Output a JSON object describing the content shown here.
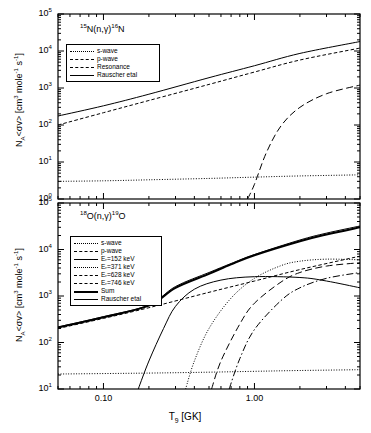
{
  "figure": {
    "width": 371,
    "height": 433,
    "background": "#ffffff",
    "line_color": "#000000"
  },
  "axes": {
    "x": {
      "label_plain": "T9 [GK]",
      "label_base": "T",
      "label_sub": "9",
      "label_unit": " [GK]",
      "scale": "log",
      "range": [
        0.05,
        5.0
      ],
      "tick_labels": [
        "0.10",
        "1.00"
      ],
      "tick_values": [
        0.1,
        1.0
      ]
    },
    "y_top": {
      "label_plain": "N_A<sv> [cm3 mole-1 s-1]",
      "scale": "log",
      "range": [
        1,
        100000
      ],
      "tick_labels": [
        "10^0",
        "10^1",
        "10^2",
        "10^3",
        "10^4",
        "10^5"
      ],
      "tick_exponents": [
        "0",
        "1",
        "2",
        "3",
        "4",
        "5"
      ]
    },
    "y_bottom": {
      "label_plain": "N_A<sv> [cm3 mole-1 s-1]",
      "scale": "log",
      "range": [
        10,
        100000
      ],
      "tick_labels": [
        "10^1",
        "10^2",
        "10^3",
        "10^4",
        "10^5"
      ],
      "tick_exponents": [
        "1",
        "2",
        "3",
        "4",
        "5"
      ]
    },
    "y_label": {
      "prefix": "N",
      "prefix_sub": "A",
      "middle": "<σv> [cm",
      "sup1": "3",
      "mid2": " mole",
      "sup2": "-1",
      "mid3": " s",
      "sup3": "-1",
      "suffix": "]"
    }
  },
  "chart_data": [
    {
      "type": "line",
      "panel": "top",
      "title": "15N(n,γ)16N",
      "annotation": {
        "pre_sup": "15",
        "elem1": "N(n,γ)",
        "post_sup": "16",
        "elem2": "N"
      },
      "xlabel": "",
      "ylabel": "N_A<σv> [cm3 mole-1 s-1]",
      "xscale": "log",
      "yscale": "log",
      "xlim": [
        0.05,
        5.0
      ],
      "ylim": [
        1,
        100000
      ],
      "grid": false,
      "legend_position": "upper-left",
      "series": [
        {
          "name": "s-wave",
          "style": "dotted",
          "width": 1,
          "points": [
            [
              0.05,
              3.0
            ],
            [
              0.1,
              3.1
            ],
            [
              0.2,
              3.3
            ],
            [
              0.5,
              3.6
            ],
            [
              1.0,
              3.9
            ],
            [
              2.0,
              4.2
            ],
            [
              5.0,
              4.5
            ]
          ]
        },
        {
          "name": "p-wave",
          "style": "dashed",
          "width": 1,
          "points": [
            [
              0.05,
              100
            ],
            [
              0.1,
              215
            ],
            [
              0.2,
              460
            ],
            [
              0.5,
              1250
            ],
            [
              1.0,
              2700
            ],
            [
              2.0,
              5700
            ],
            [
              5.0,
              12000
            ]
          ]
        },
        {
          "name": "Resonance",
          "style": "longdash",
          "width": 1,
          "points": [
            [
              0.9,
              1.0
            ],
            [
              1.0,
              2.5
            ],
            [
              1.2,
              18
            ],
            [
              1.5,
              95
            ],
            [
              2.0,
              300
            ],
            [
              3.0,
              700
            ],
            [
              5.0,
              1200
            ]
          ]
        },
        {
          "name": "Rauscher etal",
          "style": "solid",
          "width": 1,
          "points": [
            [
              0.05,
              175
            ],
            [
              0.1,
              330
            ],
            [
              0.2,
              680
            ],
            [
              0.5,
              1900
            ],
            [
              1.0,
              4000
            ],
            [
              2.0,
              8600
            ],
            [
              5.0,
              18000
            ]
          ]
        }
      ]
    },
    {
      "type": "line",
      "panel": "bottom",
      "title": "18O(n,γ)19O",
      "annotation": {
        "pre_sup": "18",
        "elem1": "O(n,γ)",
        "post_sup": "19",
        "elem2": "O"
      },
      "xlabel": "T9 [GK]",
      "ylabel": "N_A<σv> [cm3 mole-1 s-1]",
      "xscale": "log",
      "yscale": "log",
      "xlim": [
        0.05,
        5.0
      ],
      "ylim": [
        10,
        100000
      ],
      "grid": false,
      "legend_position": "upper-left",
      "series": [
        {
          "name": "s-wave",
          "style": "dotted",
          "width": 1,
          "points": [
            [
              0.05,
              21
            ],
            [
              0.2,
              22
            ],
            [
              0.5,
              23
            ],
            [
              1.0,
              24
            ],
            [
              2.0,
              25
            ],
            [
              5.0,
              26
            ]
          ]
        },
        {
          "name": "p-wave",
          "style": "dashed",
          "width": 1,
          "points": [
            [
              0.05,
              200
            ],
            [
              0.1,
              330
            ],
            [
              0.2,
              560
            ],
            [
              0.5,
              1200
            ],
            [
              1.0,
              2100
            ],
            [
              2.0,
              3700
            ],
            [
              5.0,
              7200
            ]
          ]
        },
        {
          "name": "Er=152 keV",
          "style": "solid",
          "width": 1,
          "points": [
            [
              0.17,
              10
            ],
            [
              0.2,
              40
            ],
            [
              0.25,
              200
            ],
            [
              0.3,
              600
            ],
            [
              0.4,
              1400
            ],
            [
              0.6,
              2200
            ],
            [
              1.0,
              2600
            ],
            [
              2.0,
              2500
            ],
            [
              3.0,
              2100
            ],
            [
              5.0,
              1500
            ]
          ]
        },
        {
          "name": "Er=371 keV",
          "style": "dotted",
          "width": 1,
          "points": [
            [
              0.35,
              10
            ],
            [
              0.4,
              40
            ],
            [
              0.5,
              200
            ],
            [
              0.7,
              900
            ],
            [
              1.0,
              2400
            ],
            [
              1.5,
              4500
            ],
            [
              2.0,
              5600
            ],
            [
              3.0,
              6200
            ],
            [
              5.0,
              6000
            ]
          ]
        },
        {
          "name": "Er=628 keV",
          "style": "longdash",
          "width": 1,
          "points": [
            [
              0.52,
              10
            ],
            [
              0.6,
              40
            ],
            [
              0.8,
              250
            ],
            [
              1.0,
              700
            ],
            [
              1.5,
              2000
            ],
            [
              2.0,
              3200
            ],
            [
              3.0,
              4400
            ],
            [
              5.0,
              5200
            ]
          ]
        },
        {
          "name": "Er=746 keV",
          "style": "dashdot",
          "width": 1,
          "points": [
            [
              0.68,
              10
            ],
            [
              0.8,
              45
            ],
            [
              1.0,
              190
            ],
            [
              1.5,
              800
            ],
            [
              2.0,
              1500
            ],
            [
              3.0,
              2400
            ],
            [
              5.0,
              3200
            ]
          ]
        },
        {
          "name": "Sum",
          "style": "solid",
          "width": 2,
          "points": [
            [
              0.05,
              210
            ],
            [
              0.1,
              350
            ],
            [
              0.2,
              620
            ],
            [
              0.3,
              1500
            ],
            [
              0.5,
              3000
            ],
            [
              0.7,
              4800
            ],
            [
              1.0,
              7500
            ],
            [
              2.0,
              15000
            ],
            [
              3.0,
              21000
            ],
            [
              5.0,
              30000
            ]
          ]
        },
        {
          "name": "Rauscher etal",
          "style": "solid",
          "width": 1,
          "points": [
            [
              0.05,
              215
            ],
            [
              0.1,
              360
            ],
            [
              0.2,
              640
            ],
            [
              0.3,
              1600
            ],
            [
              0.5,
              3200
            ],
            [
              0.7,
              5000
            ],
            [
              1.0,
              7800
            ],
            [
              2.0,
              16000
            ],
            [
              3.0,
              22500
            ],
            [
              5.0,
              32000
            ]
          ]
        }
      ]
    }
  ],
  "legends": {
    "top": [
      {
        "label": "s-wave",
        "style": "dotted"
      },
      {
        "label": "p-wave",
        "style": "dashed"
      },
      {
        "label": "Resonance",
        "style": "longdash"
      },
      {
        "label": "Rauscher etal",
        "style": "solid"
      }
    ],
    "bottom": [
      {
        "label": "s-wave",
        "style": "dotted"
      },
      {
        "label": "p-wave",
        "style": "dashed"
      },
      {
        "label": "Eᵣ=152 keV",
        "style": "solid"
      },
      {
        "label": "Eᵣ=371 keV",
        "style": "dotted"
      },
      {
        "label": "Eᵣ=628 keV",
        "style": "longdash"
      },
      {
        "label": "Eᵣ=746 keV",
        "style": "dashdot"
      },
      {
        "label": "Sum",
        "style": "thick"
      },
      {
        "label": "Rauscher etal",
        "style": "solid"
      }
    ]
  }
}
